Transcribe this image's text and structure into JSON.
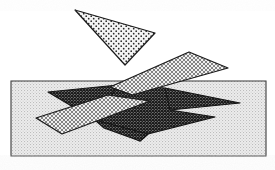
{
  "figure": {
    "caption": "",
    "width": 275,
    "height": 170,
    "background_color": "#ffffff",
    "stroke_color": "#1a1a1a"
  },
  "shapes": [
    {
      "id": "ground-rectangle",
      "name": "ground-rectangle",
      "role": "background plane",
      "fill_style": "light-stipple",
      "fill_color": "#e3e3e3",
      "stroke_color": "#3a3a3a",
      "stroke_width": 1.1,
      "points": "11,81 266,81 266,156 11,156"
    },
    {
      "id": "top-triangle",
      "name": "dotted-triangle",
      "role": "floating triangle",
      "fill_style": "dot-grid",
      "fill_color": "#f2f2f2",
      "stroke_color": "#1a1a1a",
      "stroke_width": 1.2,
      "points": "75,10 155,33 125,65"
    },
    {
      "id": "upper-parallelogram",
      "name": "crosshatch-ramp-parallelogram",
      "role": "tilted plane entering rectangle",
      "fill_style": "cross-hatch",
      "fill_color": "#ececec",
      "stroke_color": "#1a1a1a",
      "stroke_width": 1.2,
      "points": "189,52 228,68 132,95 110,87"
    },
    {
      "id": "dark-polygon",
      "name": "dark-crosshatch-polygon",
      "role": "dark intersecting plane",
      "fill_style": "dark-cross-hatch",
      "fill_color": "#575757",
      "stroke_color": "#141414",
      "stroke_width": 1.1,
      "points": "48,92 118,85 165,88 240,103 170,110 215,117 148,134 140,141 95,120"
    },
    {
      "id": "light-polygon",
      "name": "light-crosshatch-parallelogram",
      "role": "light intersecting plane",
      "fill_style": "cross-hatch",
      "fill_color": "#efefef",
      "stroke_color": "#1a1a1a",
      "stroke_width": 1.2,
      "points": "36,118 108,95 150,101 62,134"
    },
    {
      "id": "dark-tail",
      "name": "dark-lower-wedge",
      "role": "dark plane lower tail",
      "fill_style": "dark-cross-hatch",
      "fill_color": "#575757",
      "stroke_color": "#141414",
      "stroke_width": 1.1,
      "points": "95,120 148,134 140,141 104,128"
    }
  ],
  "edges": [
    {
      "id": "edge-ramp-to-rect",
      "name": "ramp-intersection-line",
      "points": "110,87 132,95"
    },
    {
      "id": "edge-dark-crease",
      "name": "dark-polygon-crease",
      "points": "118,85 95,120"
    },
    {
      "id": "edge-dark-right-crease",
      "name": "dark-polygon-right-crease",
      "points": "165,88 170,110"
    }
  ]
}
